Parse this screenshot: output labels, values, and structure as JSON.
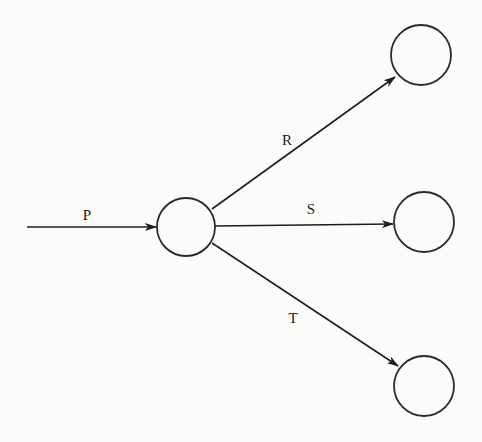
{
  "diagram": {
    "type": "flow-graph",
    "colors": {
      "stroke": "#1e1e1e",
      "background": "#fbfbf9"
    },
    "nodes": [
      {
        "id": "center",
        "cx": 186,
        "cy": 227,
        "r": 29
      },
      {
        "id": "top-right",
        "cx": 421,
        "cy": 55,
        "r": 30
      },
      {
        "id": "middle-right",
        "cx": 424,
        "cy": 222,
        "r": 30
      },
      {
        "id": "bottom-right",
        "cx": 424,
        "cy": 386,
        "r": 30
      }
    ],
    "edges": [
      {
        "id": "P",
        "label": "P",
        "from": "input",
        "to": "center",
        "x1": 27,
        "y1": 227,
        "x2": 156,
        "y2": 227,
        "label_x": 87,
        "label_y": 220
      },
      {
        "id": "R",
        "label": "R",
        "from": "center",
        "to": "top-right",
        "x1": 212,
        "y1": 209,
        "x2": 395,
        "y2": 77,
        "label_x": 287,
        "label_y": 145
      },
      {
        "id": "S",
        "label": "S",
        "from": "center",
        "to": "middle-right",
        "x1": 215,
        "y1": 226,
        "x2": 393,
        "y2": 224,
        "label_x": 311,
        "label_y": 214
      },
      {
        "id": "T",
        "label": "T",
        "from": "center",
        "to": "bottom-right",
        "x1": 212,
        "y1": 243,
        "x2": 398,
        "y2": 366,
        "label_x": 293,
        "label_y": 323
      }
    ]
  }
}
